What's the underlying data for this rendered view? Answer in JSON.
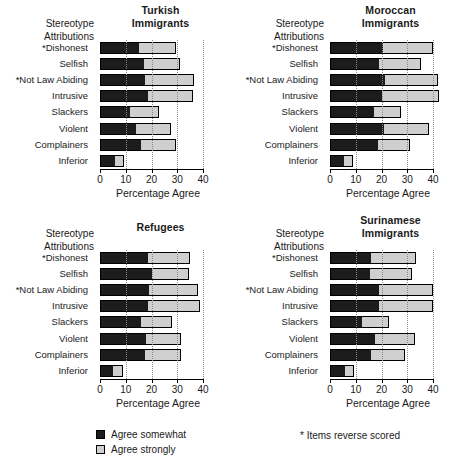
{
  "figure": {
    "axis_header": "Stereotype\nAttributions",
    "axis_header_line1": "Stereotype",
    "axis_header_line2": "Attributions",
    "xlabel": "Percentage Agree",
    "xticks": [
      "0",
      "10",
      "20",
      "30",
      "40"
    ],
    "footnote": "* Items reverse scored"
  },
  "legend": {
    "items": [
      {
        "label": "Agree somewhat",
        "color": "#1c1c1c"
      },
      {
        "label": "Agree strongly",
        "color": "#cfcfcf"
      }
    ]
  },
  "chart_data": [
    {
      "type": "bar",
      "orientation": "horizontal",
      "stacked": true,
      "title": "Turkish Immigrants",
      "title_line1": "Turkish",
      "title_line2": "Immigrants",
      "xlabel": "Percentage Agree",
      "ylabel": "Stereotype Attributions",
      "xlim": [
        0,
        40
      ],
      "xticks": [
        0,
        10,
        20,
        30,
        40
      ],
      "grid": "vertical-dotted",
      "categories": [
        "*Dishonest",
        "Selfish",
        "*Not Law Abiding",
        "Intrusive",
        "Slackers",
        "Violent",
        "Complainers",
        "Inferior"
      ],
      "series": [
        {
          "name": "Agree somewhat",
          "values": [
            15.0,
            17.0,
            17.5,
            18.5,
            11.5,
            14.0,
            16.0,
            6.0
          ]
        },
        {
          "name": "Agree strongly",
          "values": [
            14.5,
            14.0,
            19.0,
            17.5,
            11.5,
            13.5,
            13.5,
            3.5
          ]
        }
      ],
      "totals": [
        29.5,
        31.0,
        36.5,
        36.0,
        23.0,
        27.5,
        29.5,
        9.5
      ]
    },
    {
      "type": "bar",
      "orientation": "horizontal",
      "stacked": true,
      "title": "Moroccan Immigrants",
      "title_line1": "Moroccan",
      "title_line2": "Immigrants",
      "xlabel": "Percentage Agree",
      "ylabel": "Stereotype Attributions",
      "xlim": [
        0,
        40
      ],
      "xticks": [
        0,
        10,
        20,
        30,
        40
      ],
      "grid": "vertical-dotted",
      "categories": [
        "*Dishonest",
        "Selfish",
        "*Not Law Abiding",
        "Intrusive",
        "Slackers",
        "Violent",
        "Complainers",
        "Inferior"
      ],
      "series": [
        {
          "name": "Agree somewhat",
          "values": [
            20.5,
            19.0,
            21.5,
            20.0,
            17.0,
            21.0,
            18.5,
            5.5
          ]
        },
        {
          "name": "Agree strongly",
          "values": [
            19.5,
            16.5,
            20.5,
            22.5,
            10.5,
            17.5,
            12.5,
            3.5
          ]
        }
      ],
      "totals": [
        40.0,
        35.5,
        42.0,
        42.5,
        27.5,
        38.5,
        31.0,
        9.0
      ]
    },
    {
      "type": "bar",
      "orientation": "horizontal",
      "stacked": true,
      "title": "Refugees",
      "title_line1": "Refugees",
      "title_line2": "",
      "xlabel": "Percentage Agree",
      "ylabel": "Stereotype Attributions",
      "xlim": [
        0,
        40
      ],
      "xticks": [
        0,
        10,
        20,
        30,
        40
      ],
      "grid": "vertical-dotted",
      "categories": [
        "*Dishonest",
        "Selfish",
        "*Not Law Abiding",
        "Intrusive",
        "Slackers",
        "Violent",
        "Complainers",
        "Inferior"
      ],
      "series": [
        {
          "name": "Agree somewhat",
          "values": [
            18.5,
            20.0,
            19.0,
            18.5,
            16.0,
            18.0,
            17.5,
            5.0
          ]
        },
        {
          "name": "Agree strongly",
          "values": [
            16.5,
            14.5,
            19.0,
            20.5,
            12.0,
            13.5,
            14.0,
            4.0
          ]
        }
      ],
      "totals": [
        35.0,
        34.5,
        38.0,
        39.0,
        28.0,
        31.5,
        31.5,
        9.0
      ]
    },
    {
      "type": "bar",
      "orientation": "horizontal",
      "stacked": true,
      "title": "Surinamese Immigrants",
      "title_line1": "Surinamese",
      "title_line2": "Immigrants",
      "xlabel": "Percentage Agree",
      "ylabel": "Stereotype Attributions",
      "xlim": [
        0,
        40
      ],
      "xticks": [
        0,
        10,
        20,
        30,
        40
      ],
      "grid": "vertical-dotted",
      "categories": [
        "*Dishonest",
        "Selfish",
        "*Not Law Abiding",
        "Intrusive",
        "Slackers",
        "Violent",
        "Complainers",
        "Inferior"
      ],
      "series": [
        {
          "name": "Agree somewhat",
          "values": [
            16.0,
            15.5,
            19.0,
            19.0,
            12.5,
            17.5,
            16.0,
            6.0
          ]
        },
        {
          "name": "Agree strongly",
          "values": [
            17.5,
            16.5,
            21.0,
            21.0,
            10.5,
            15.5,
            13.0,
            3.5
          ]
        }
      ],
      "totals": [
        33.5,
        32.0,
        40.0,
        40.0,
        23.0,
        33.0,
        29.0,
        9.5
      ]
    }
  ]
}
